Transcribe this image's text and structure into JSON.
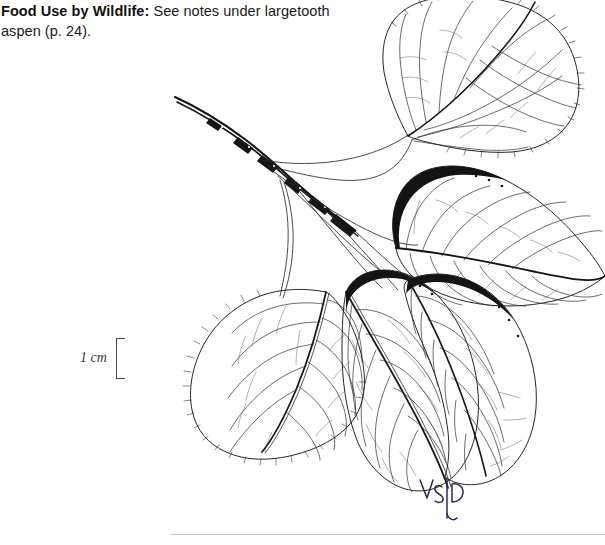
{
  "page": {
    "background_color": "#ffffff",
    "ink_color": "#1a1a1a",
    "rule_color": "#c9c9c9"
  },
  "caption": {
    "lead_label": "Food Use by Wildlife:",
    "body_text": " See notes under largetooth aspen (p. 24)."
  },
  "scale_bar": {
    "label": "1 cm",
    "bracket_name": "scale-bracket"
  },
  "illustration": {
    "subject": "aspen twig with five leaves",
    "technique": "pen-and-ink line drawing",
    "parts": [
      {
        "name": "twig",
        "label": "twig"
      },
      {
        "name": "leaf-upper-right",
        "label": "leaf"
      },
      {
        "name": "leaf-middle-right",
        "label": "leaf"
      },
      {
        "name": "leaf-lower-left",
        "label": "leaf"
      },
      {
        "name": "leaf-lower-center",
        "label": "leaf"
      },
      {
        "name": "leaf-lower-right",
        "label": "leaf"
      }
    ]
  },
  "signature": {
    "text": "S|B"
  }
}
